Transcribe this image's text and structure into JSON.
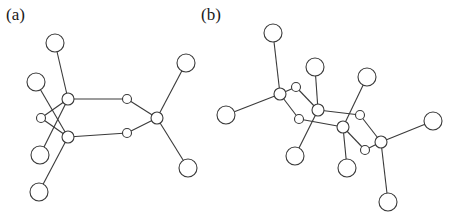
{
  "panels": [
    {
      "label": "(a)",
      "nodes": [
        {
          "id": "a_top",
          "x": 55,
          "y": 43,
          "r": 9
        },
        {
          "id": "a_left_upper",
          "x": 36,
          "y": 82,
          "r": 9
        },
        {
          "id": "a_hub_upper",
          "x": 68,
          "y": 99,
          "r": 6
        },
        {
          "id": "a_small_left",
          "x": 41,
          "y": 118,
          "r": 4.5
        },
        {
          "id": "a_hub_lower",
          "x": 68,
          "y": 137,
          "r": 6
        },
        {
          "id": "a_left_lower",
          "x": 40,
          "y": 155,
          "r": 9
        },
        {
          "id": "a_bottom",
          "x": 39,
          "y": 192,
          "r": 9
        },
        {
          "id": "a_ring_upper",
          "x": 127,
          "y": 99,
          "r": 4.5
        },
        {
          "id": "a_ring_lower",
          "x": 127,
          "y": 133,
          "r": 4.5
        },
        {
          "id": "a_hub_right",
          "x": 157,
          "y": 118,
          "r": 6
        },
        {
          "id": "a_top_right",
          "x": 186,
          "y": 63,
          "r": 9
        },
        {
          "id": "a_bottom_right",
          "x": 188,
          "y": 168,
          "r": 9
        }
      ],
      "edges": [
        [
          "a_hub_upper",
          "a_top"
        ],
        [
          "a_hub_lower",
          "a_left_upper"
        ],
        [
          "a_hub_upper",
          "a_left_lower"
        ],
        [
          "a_hub_lower",
          "a_bottom"
        ],
        [
          "a_small_left",
          "a_hub_upper"
        ],
        [
          "a_small_left",
          "a_hub_lower"
        ],
        [
          "a_hub_upper",
          "a_ring_upper"
        ],
        [
          "a_hub_lower",
          "a_ring_lower"
        ],
        [
          "a_ring_upper",
          "a_hub_right"
        ],
        [
          "a_ring_lower",
          "a_hub_right"
        ],
        [
          "a_hub_right",
          "a_top_right"
        ],
        [
          "a_hub_right",
          "a_bottom_right"
        ]
      ]
    },
    {
      "label": "(b)",
      "nodes": [
        {
          "id": "b_top",
          "x": 273,
          "y": 33,
          "r": 9
        },
        {
          "id": "b_left",
          "x": 226,
          "y": 115,
          "r": 9
        },
        {
          "id": "b_hub1",
          "x": 280,
          "y": 94,
          "r": 6
        },
        {
          "id": "b_small1",
          "x": 296,
          "y": 87,
          "r": 4.5
        },
        {
          "id": "b_small2",
          "x": 299,
          "y": 119,
          "r": 4.5
        },
        {
          "id": "b_top_mid",
          "x": 315,
          "y": 67,
          "r": 9
        },
        {
          "id": "b_hub2",
          "x": 318,
          "y": 110,
          "r": 6
        },
        {
          "id": "b_lower_left",
          "x": 295,
          "y": 156,
          "r": 9
        },
        {
          "id": "b_top_right",
          "x": 367,
          "y": 77,
          "r": 9
        },
        {
          "id": "b_small3",
          "x": 360,
          "y": 115,
          "r": 4.5
        },
        {
          "id": "b_hub3",
          "x": 343,
          "y": 127,
          "r": 6
        },
        {
          "id": "b_bottom_mid",
          "x": 347,
          "y": 168,
          "r": 9
        },
        {
          "id": "b_small5",
          "x": 365,
          "y": 150,
          "r": 4.5
        },
        {
          "id": "b_hub4",
          "x": 381,
          "y": 142,
          "r": 6
        },
        {
          "id": "b_right",
          "x": 433,
          "y": 121,
          "r": 9
        },
        {
          "id": "b_bottom",
          "x": 388,
          "y": 202,
          "r": 9
        }
      ],
      "edges": [
        [
          "b_hub1",
          "b_top"
        ],
        [
          "b_hub1",
          "b_left"
        ],
        [
          "b_hub1",
          "b_small1"
        ],
        [
          "b_hub1",
          "b_small2"
        ],
        [
          "b_small1",
          "b_hub2"
        ],
        [
          "b_small2",
          "b_hub3"
        ],
        [
          "b_hub2",
          "b_top_mid"
        ],
        [
          "b_hub2",
          "b_lower_left"
        ],
        [
          "b_hub2",
          "b_small3"
        ],
        [
          "b_hub3",
          "b_top_right"
        ],
        [
          "b_hub3",
          "b_bottom_mid"
        ],
        [
          "b_hub3",
          "b_small5"
        ],
        [
          "b_small3",
          "b_hub4"
        ],
        [
          "b_small5",
          "b_hub4"
        ],
        [
          "b_hub4",
          "b_right"
        ],
        [
          "b_hub4",
          "b_bottom"
        ]
      ]
    }
  ],
  "colors": {
    "stroke": "#3a3a3a",
    "fill": "#ffffff",
    "background": "#ffffff"
  }
}
